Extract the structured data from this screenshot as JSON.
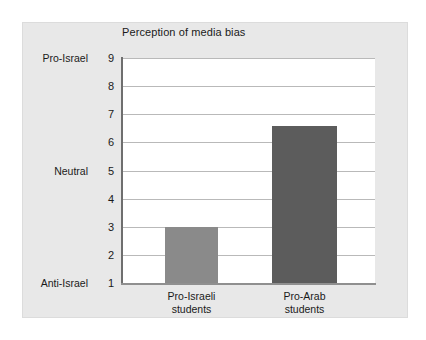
{
  "chart_data": {
    "type": "bar",
    "title": "Perception of media bias",
    "xlabel": "",
    "ylabel": "",
    "categories": [
      "Pro-Israeli students",
      "Pro-Arab students"
    ],
    "values": [
      3.0,
      6.6
    ],
    "ylim": [
      1,
      9
    ],
    "yticks": [
      1,
      2,
      3,
      4,
      5,
      6,
      7,
      8,
      9
    ],
    "ytick_labels": [
      "1",
      "2",
      "3",
      "4",
      "5",
      "6",
      "7",
      "8",
      "9"
    ],
    "y_category_labels": [
      {
        "value": 9,
        "label": "Pro-Israel"
      },
      {
        "value": 5,
        "label": "Neutral"
      },
      {
        "value": 1,
        "label": "Anti-Israel"
      }
    ],
    "bars": [
      {
        "category_line1": "Pro-Israeli",
        "category_line2": "students",
        "value": 3.0,
        "color": "#8a8a8a"
      },
      {
        "category_line1": "Pro-Arab",
        "category_line2": "students",
        "value": 6.6,
        "color": "#5c5c5c"
      }
    ],
    "grid": true,
    "legend": "none",
    "colors": {
      "bar_light": "#8a8a8a",
      "bar_dark": "#5c5c5c",
      "panel_background": "#e8e8e8",
      "plot_background": "#ffffff",
      "gridline": "#b9b9b9",
      "axis": "#6e6e6e",
      "text": "#1a1a1a"
    }
  }
}
